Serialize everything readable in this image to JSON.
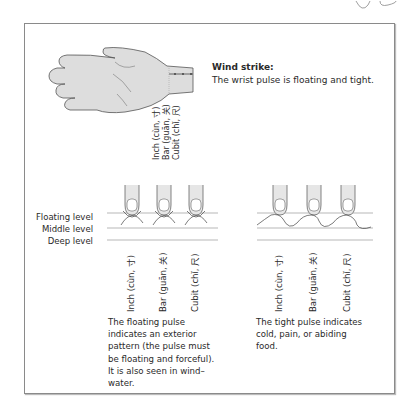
{
  "figure": {
    "wind_strike": {
      "title": "Wind strike:",
      "text": "The wrist pulse is floating and tight."
    },
    "positions": [
      "Inch (cùn, 寸)",
      "Bar (guān, 关)",
      "Cubit (chǐ, 尺)"
    ],
    "levels": [
      "Floating level",
      "Middle level",
      "Deep level"
    ],
    "floating_caption": "The floating pulse indicates an exterior pattern (the pulse must be floating and forceful). It is also seen in wind–water.",
    "tight_caption": "The tight pulse indicates cold, pain, or abiding food."
  }
}
